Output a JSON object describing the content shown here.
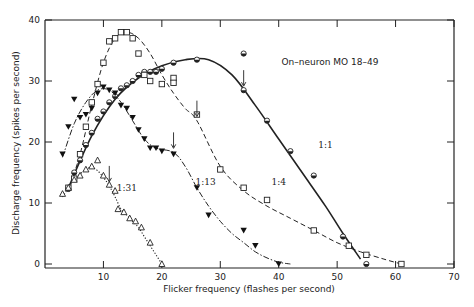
{
  "chart_data": {
    "type": "line",
    "title": "",
    "annotation_title": "On–neuron MO 18–49",
    "xlabel": "Flicker frequency (flashes per second)",
    "ylabel": "Discharge frequency (spikes per second)",
    "xlim": [
      0,
      70
    ],
    "ylim": [
      0,
      40
    ],
    "xticks": [
      10,
      20,
      30,
      40,
      50,
      60,
      70
    ],
    "yticks": [
      0,
      10,
      20,
      30,
      40
    ],
    "grid": false,
    "legend": "none (curves labeled inline)",
    "series": [
      {
        "name": "1:1",
        "marker": "half-filled-circle",
        "line": "solid",
        "arrow_x": 34,
        "label_pos": [
          48,
          19
        ],
        "points": [
          [
            4,
            12.3
          ],
          [
            5,
            15
          ],
          [
            6,
            17
          ],
          [
            7,
            19.5
          ],
          [
            8,
            21.5
          ],
          [
            9,
            23.8
          ],
          [
            10,
            25
          ],
          [
            11,
            26.5
          ],
          [
            12,
            27.5
          ],
          [
            13,
            28.8
          ],
          [
            14,
            29.3
          ],
          [
            15,
            30
          ],
          [
            16,
            31
          ],
          [
            17,
            31.5
          ],
          [
            18,
            31.5
          ],
          [
            19,
            31.5
          ],
          [
            20,
            32
          ],
          [
            22,
            33
          ],
          [
            26,
            33.5
          ],
          [
            34,
            34.5
          ],
          [
            34,
            28.5
          ],
          [
            38,
            23.5
          ],
          [
            42,
            18.5
          ],
          [
            46,
            14.5
          ],
          [
            51,
            4.5
          ],
          [
            55,
            0
          ]
        ],
        "curve": [
          [
            4,
            12.5
          ],
          [
            8,
            21
          ],
          [
            12,
            27
          ],
          [
            16,
            30.5
          ],
          [
            20,
            32.5
          ],
          [
            24,
            33.5
          ],
          [
            28,
            33.5
          ],
          [
            32,
            31
          ],
          [
            36,
            26
          ],
          [
            40,
            20.5
          ],
          [
            44,
            15
          ],
          [
            48,
            9.5
          ],
          [
            51,
            5
          ],
          [
            54,
            0.8
          ]
        ]
      },
      {
        "name": "1:4",
        "marker": "open-square",
        "line": "dashed",
        "arrow_x": 26,
        "label_pos": [
          40,
          13
        ],
        "points": [
          [
            4,
            12.5
          ],
          [
            5,
            14
          ],
          [
            6,
            18
          ],
          [
            7,
            22.5
          ],
          [
            8,
            26.5
          ],
          [
            9,
            29.5
          ],
          [
            10,
            33
          ],
          [
            11,
            36.5
          ],
          [
            12,
            37
          ],
          [
            13,
            38
          ],
          [
            14,
            38
          ],
          [
            15,
            37
          ],
          [
            16,
            34.5
          ],
          [
            17,
            31
          ],
          [
            18,
            30
          ],
          [
            20,
            29.5
          ],
          [
            22,
            30.5
          ],
          [
            22,
            29.7
          ],
          [
            26,
            24.5
          ],
          [
            30,
            15.5
          ],
          [
            34,
            12.5
          ],
          [
            38,
            10.5
          ],
          [
            46,
            5.5
          ],
          [
            52,
            3
          ],
          [
            55,
            1.5
          ],
          [
            61,
            0
          ]
        ],
        "curve": [
          [
            4,
            12
          ],
          [
            6,
            18
          ],
          [
            8,
            26
          ],
          [
            10,
            33
          ],
          [
            12,
            37
          ],
          [
            14,
            38
          ],
          [
            16,
            37
          ],
          [
            18,
            34.5
          ],
          [
            20,
            31
          ],
          [
            22,
            28
          ],
          [
            24,
            25.5
          ],
          [
            26,
            23.5
          ],
          [
            30,
            16
          ],
          [
            34,
            12
          ],
          [
            38,
            9.5
          ],
          [
            42,
            7.5
          ],
          [
            46,
            5.5
          ],
          [
            50,
            3.5
          ],
          [
            54,
            2
          ],
          [
            58,
            0.8
          ],
          [
            61,
            0
          ]
        ]
      },
      {
        "name": "1:13",
        "marker": "filled-inverted-triangle",
        "line": "dash-dot",
        "arrow_x": 22,
        "label_pos": [
          27.5,
          13
        ],
        "points": [
          [
            3,
            18
          ],
          [
            4,
            22.5
          ],
          [
            5,
            27
          ],
          [
            6,
            24
          ],
          [
            7,
            24.5
          ],
          [
            8,
            25.5
          ],
          [
            9,
            28
          ],
          [
            10,
            29
          ],
          [
            11,
            28.5
          ],
          [
            12,
            28
          ],
          [
            13,
            26
          ],
          [
            14,
            25.5
          ],
          [
            15,
            24
          ],
          [
            16,
            22
          ],
          [
            17,
            20.5
          ],
          [
            18,
            19
          ],
          [
            19,
            19
          ],
          [
            20,
            18.5
          ],
          [
            22,
            18
          ],
          [
            26,
            12.5
          ],
          [
            28,
            8
          ],
          [
            34,
            5.5
          ],
          [
            36,
            3
          ],
          [
            40,
            0
          ]
        ],
        "curve": [
          [
            3,
            17.5
          ],
          [
            5,
            23
          ],
          [
            7,
            26.5
          ],
          [
            9,
            28.5
          ],
          [
            11,
            28.5
          ],
          [
            13,
            26.5
          ],
          [
            15,
            23.5
          ],
          [
            17,
            20.5
          ],
          [
            19,
            19
          ],
          [
            22,
            18.3
          ],
          [
            24,
            16
          ],
          [
            26,
            12.5
          ],
          [
            28,
            9.5
          ],
          [
            30,
            7
          ],
          [
            32,
            5
          ],
          [
            34,
            3.5
          ],
          [
            36,
            2
          ],
          [
            38,
            1
          ],
          [
            40,
            0.3
          ],
          [
            42,
            0
          ]
        ]
      },
      {
        "name": "1:31",
        "marker": "open-triangle",
        "line": "dotted",
        "arrow_x": 11,
        "label_pos": [
          14,
          12
        ],
        "points": [
          [
            3,
            11.5
          ],
          [
            4,
            12.5
          ],
          [
            5,
            13.8
          ],
          [
            6,
            14.5
          ],
          [
            7,
            15.5
          ],
          [
            8,
            16
          ],
          [
            9,
            17
          ],
          [
            10,
            14.5
          ],
          [
            11,
            13
          ],
          [
            12,
            12
          ],
          [
            12.5,
            9
          ],
          [
            13.5,
            8.5
          ],
          [
            14.5,
            7.5
          ],
          [
            15.5,
            7
          ],
          [
            16.5,
            6
          ],
          [
            18,
            3.5
          ],
          [
            20,
            0
          ]
        ],
        "curve": [
          [
            3,
            11
          ],
          [
            5,
            13.8
          ],
          [
            7,
            15.5
          ],
          [
            8,
            15.8
          ],
          [
            9,
            15.3
          ],
          [
            10,
            14.2
          ],
          [
            11,
            12.8
          ],
          [
            12,
            11
          ],
          [
            13,
            9
          ],
          [
            14,
            8
          ],
          [
            15,
            7
          ],
          [
            16,
            6
          ],
          [
            17,
            4.5
          ],
          [
            18,
            3
          ],
          [
            19,
            1.5
          ],
          [
            20,
            0
          ]
        ]
      }
    ]
  }
}
